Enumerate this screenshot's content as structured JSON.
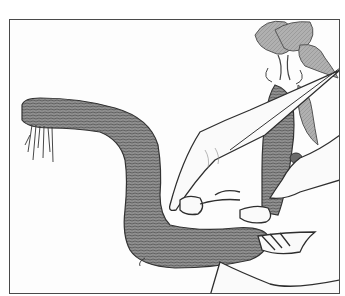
{
  "image": {
    "subject": "Illustration of a hand holding a curved horseradish root with a leafy crown",
    "style": "black-and-white pencil sketch",
    "colors": {
      "background": "#ffffff",
      "frame": "#4a4a4a",
      "root_fill": "#8c8c8c",
      "root_dark": "#4f4f4f",
      "leaf_fill": "#a8a8a8",
      "outline": "#2e2e2e",
      "hand_fill": "#fafafa"
    },
    "elements": [
      "frame-border",
      "horseradish-root",
      "root-hairs",
      "leafy-crown",
      "hand"
    ]
  }
}
